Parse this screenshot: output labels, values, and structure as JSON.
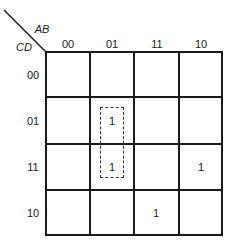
{
  "kmap": {
    "corner": {
      "col_var": "AB",
      "row_var": "CD"
    },
    "col_headers": [
      "00",
      "01",
      "11",
      "10"
    ],
    "row_headers": [
      "00",
      "01",
      "11",
      "10"
    ],
    "cells": [
      [
        "",
        "",
        "",
        ""
      ],
      [
        "",
        "1",
        "",
        ""
      ],
      [
        "",
        "1",
        "",
        "1"
      ],
      [
        "",
        "",
        "1",
        ""
      ]
    ],
    "groups": [
      {
        "style": "dashed",
        "cells": [
          [
            1,
            1
          ],
          [
            2,
            1
          ]
        ]
      }
    ]
  }
}
